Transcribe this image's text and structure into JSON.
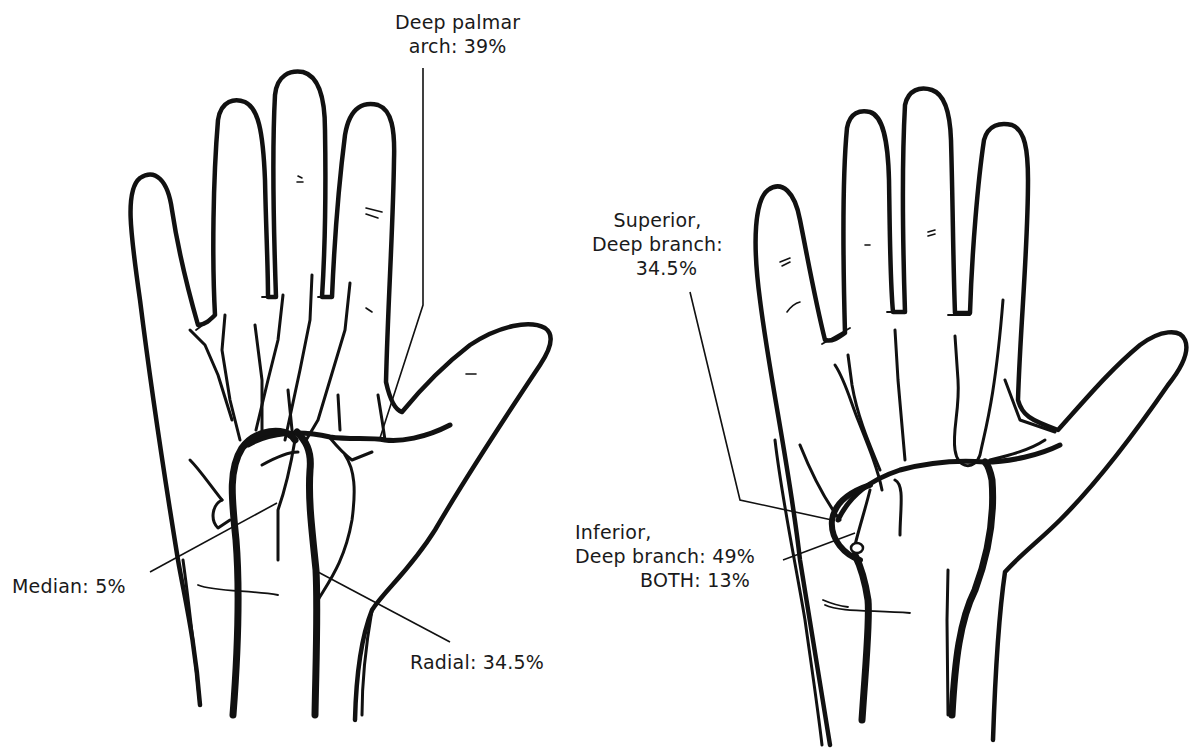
{
  "figure": {
    "type": "anatomical-illustration",
    "colors": {
      "ink": "#111111",
      "background": "#ffffff"
    }
  },
  "left_panel": {
    "labels": {
      "deep_palmar_arch": {
        "line1": "Deep palmar",
        "line2": "arch: 39%"
      },
      "median": {
        "text": "Median: 5%"
      },
      "radial": {
        "text": "Radial: 34.5%"
      }
    }
  },
  "right_panel": {
    "labels": {
      "superior_deep_branch": {
        "line1": "Superior,",
        "line2": "Deep branch:",
        "line3": "34.5%"
      },
      "inferior_deep_branch": {
        "line1": "Inferior,",
        "line2": "Deep branch: 49%",
        "line3": "BOTH: 13%"
      }
    }
  }
}
